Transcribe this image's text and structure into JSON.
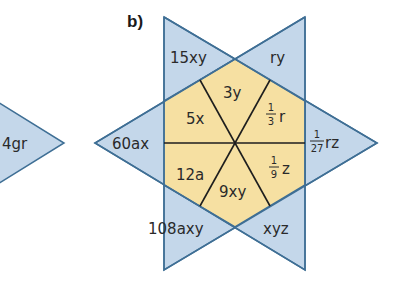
{
  "colors": {
    "blue_fill": "#c4d7ea",
    "blue_stroke": "#3f6f95",
    "yellow_fill": "#f6e0a2",
    "inner_line": "#1e1e1e"
  },
  "part_label": "b)",
  "left_fragment": {
    "label": "4gr"
  },
  "star_points": {
    "top_left": "15xy",
    "top_right": "ry",
    "left": "60ax",
    "right": {
      "numerator": "1",
      "denominator": "27",
      "suffix": "rz"
    },
    "bottom_left": "108axy",
    "bottom_right": "xyz"
  },
  "hexagon_segments": {
    "top": "3y",
    "upper_left": "5x",
    "upper_right": {
      "numerator": "1",
      "denominator": "3",
      "suffix": "r"
    },
    "lower_left": "12a",
    "bottom": "9xy",
    "lower_right": {
      "numerator": "1",
      "denominator": "9",
      "suffix": "z"
    }
  }
}
